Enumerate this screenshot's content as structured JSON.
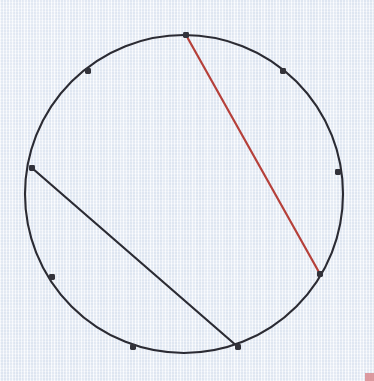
{
  "figure": {
    "canvas": {
      "width": 374,
      "height": 381
    },
    "background_color": "#e9eef6",
    "paper_texture": "light-blue-woven-paper",
    "corner_artifact_color": "#d98a8f"
  },
  "chart_data": {
    "type": "scatter",
    "xlabel": "",
    "ylabel": "",
    "xlim": [
      0,
      374
    ],
    "ylim": [
      0,
      381
    ],
    "grid": false,
    "legend": "none",
    "circle": {
      "center_x": 184,
      "center_y": 194,
      "radius": 159,
      "stroke_color": "#2b2b33",
      "stroke_width": 2.1,
      "fill": "none"
    },
    "points": [
      {
        "id": "p-top",
        "label": "A",
        "x": 186,
        "y": 35
      },
      {
        "id": "p-upper-right",
        "label": "B",
        "x": 283,
        "y": 71
      },
      {
        "id": "p-right",
        "label": "C",
        "x": 338,
        "y": 172
      },
      {
        "id": "p-lower-right",
        "label": "D",
        "x": 320,
        "y": 274
      },
      {
        "id": "p-bottom-right",
        "label": "E",
        "x": 238,
        "y": 347
      },
      {
        "id": "p-bottom",
        "label": "F",
        "x": 133,
        "y": 347
      },
      {
        "id": "p-lower-left",
        "label": "G",
        "x": 52,
        "y": 277
      },
      {
        "id": "p-left",
        "label": "H",
        "x": 32,
        "y": 168
      },
      {
        "id": "p-upper-left",
        "label": "I",
        "x": 88,
        "y": 71
      }
    ],
    "point_style": {
      "marker": "square-dot",
      "size": 6,
      "color": "#32323a"
    },
    "chords": [
      {
        "id": "chord-red",
        "name": "red-chord",
        "from_point": "p-top",
        "to_point": "p-lower-right",
        "x1": 186,
        "y1": 35,
        "x2": 320,
        "y2": 274,
        "color": "#b5403a",
        "stroke_width": 2.2
      },
      {
        "id": "chord-black",
        "name": "black-chord",
        "from_point": "p-left",
        "to_point": "p-bottom-right",
        "x1": 32,
        "y1": 168,
        "x2": 238,
        "y2": 347,
        "color": "#2b2b33",
        "stroke_width": 2.2
      }
    ]
  }
}
